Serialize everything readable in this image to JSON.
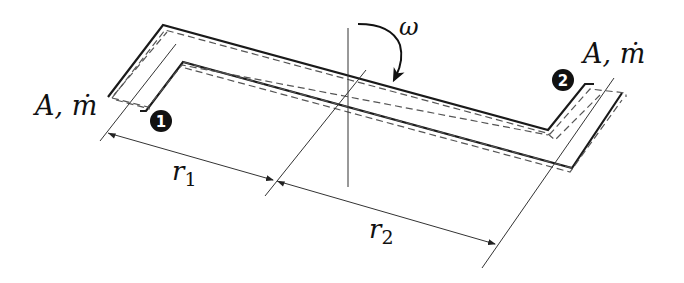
{
  "diagram": {
    "type": "rotating-pipe-schematic",
    "labels": {
      "inlet_left": "A, ṁ",
      "outlet_right": "A, ṁ",
      "omega": "ω",
      "r1": "r",
      "r1_sub": "1",
      "r2": "r",
      "r2_sub": "2",
      "badge1": "1",
      "badge2": "2"
    },
    "colors": {
      "stroke": "#1a1a1a",
      "dashed": "#555555",
      "thin": "#333333",
      "badge_fill": "#111111"
    }
  }
}
